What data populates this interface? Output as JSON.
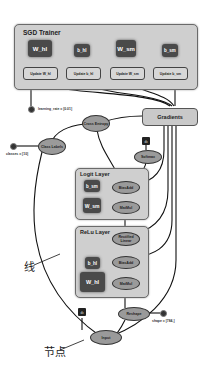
{
  "sgd_trainer": {
    "title": "SGD Trainer",
    "variables": [
      "W_hl",
      "b_hl",
      "W_sm",
      "b_sm"
    ],
    "updates": [
      "Update W_hl",
      "Update b_hl",
      "Update W_sm",
      "Update b_sm"
    ]
  },
  "learning_rate_label": "learning_rate = [0.01]",
  "classes_label": "classes = [10]",
  "shape_label": "shape = [784,]",
  "nodes": {
    "gradients": "Gradients",
    "cross_entropy": "Cross Entropy",
    "class_labels": "Class Labels",
    "softmax": "Softmax",
    "reshape": "Reshape",
    "input": "Input"
  },
  "logit_layer": {
    "title": "Logit Layer",
    "bias": "b_sm",
    "weight": "W_sm",
    "bias_add": "BiasAdd",
    "matmul": "MatMul"
  },
  "relu_layer": {
    "title": "ReLu Layer",
    "rectified": "Rectified Linear",
    "bias": "b_hl",
    "weight": "W_hl",
    "bias_add": "BiasAdd",
    "matmul": "MatMul"
  },
  "annotations": {
    "edge_label": "线",
    "node_label": "节点"
  }
}
